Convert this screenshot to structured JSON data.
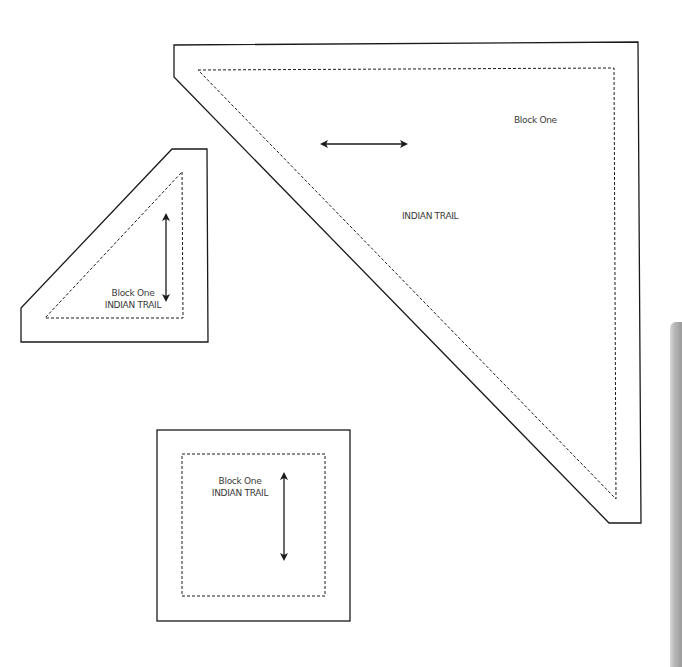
{
  "document": {
    "type": "quilt-pattern-templates",
    "colors": {
      "outline": "#1a1a1a",
      "seam_line": "#1a1a1a",
      "text": "#3a3a3a",
      "side_tab": "#a8a8a8"
    }
  },
  "pieces": [
    {
      "id": "large-triangle",
      "block_label": "Block One",
      "pattern_label": "INDIAN TRAIL",
      "grain_arrow": "horizontal"
    },
    {
      "id": "small-triangle",
      "block_label": "Block One",
      "pattern_label": "INDIAN TRAIL",
      "grain_arrow": "vertical"
    },
    {
      "id": "square",
      "block_label": "Block One",
      "pattern_label": "INDIAN TRAIL",
      "grain_arrow": "vertical"
    }
  ]
}
